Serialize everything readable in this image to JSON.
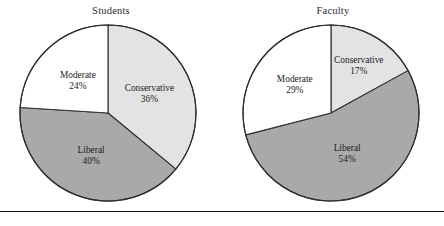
{
  "figure": {
    "background": "#ffffff",
    "rule_color": "#111111",
    "colors": {
      "conservative": "#e3e3e3",
      "moderate": "#ffffff",
      "liberal": "#a9a9a9",
      "outline": "#2f2f2f",
      "text": "#1c1c1c"
    }
  },
  "chart_data": [
    {
      "type": "pie",
      "title": "Students",
      "categories": [
        "Conservative",
        "Liberal",
        "Moderate"
      ],
      "values": [
        36,
        40,
        24
      ],
      "unit": "%",
      "labels": [
        {
          "name": "Conservative",
          "pct": "36%",
          "fill": "#e3e3e3"
        },
        {
          "name": "Liberal",
          "pct": "40%",
          "fill": "#a9a9a9"
        },
        {
          "name": "Moderate",
          "pct": "24%",
          "fill": "#ffffff"
        }
      ],
      "start_angle_deg": 0,
      "direction": "clockwise",
      "legend": "none",
      "grid": false
    },
    {
      "type": "pie",
      "title": "Faculty",
      "categories": [
        "Conservative",
        "Liberal",
        "Moderate"
      ],
      "values": [
        17,
        54,
        29
      ],
      "unit": "%",
      "labels": [
        {
          "name": "Conservative",
          "pct": "17%",
          "fill": "#e3e3e3"
        },
        {
          "name": "Liberal",
          "pct": "54%",
          "fill": "#a9a9a9"
        },
        {
          "name": "Moderate",
          "pct": "29%",
          "fill": "#ffffff"
        }
      ],
      "start_angle_deg": 0,
      "direction": "clockwise",
      "legend": "none",
      "grid": false
    }
  ]
}
